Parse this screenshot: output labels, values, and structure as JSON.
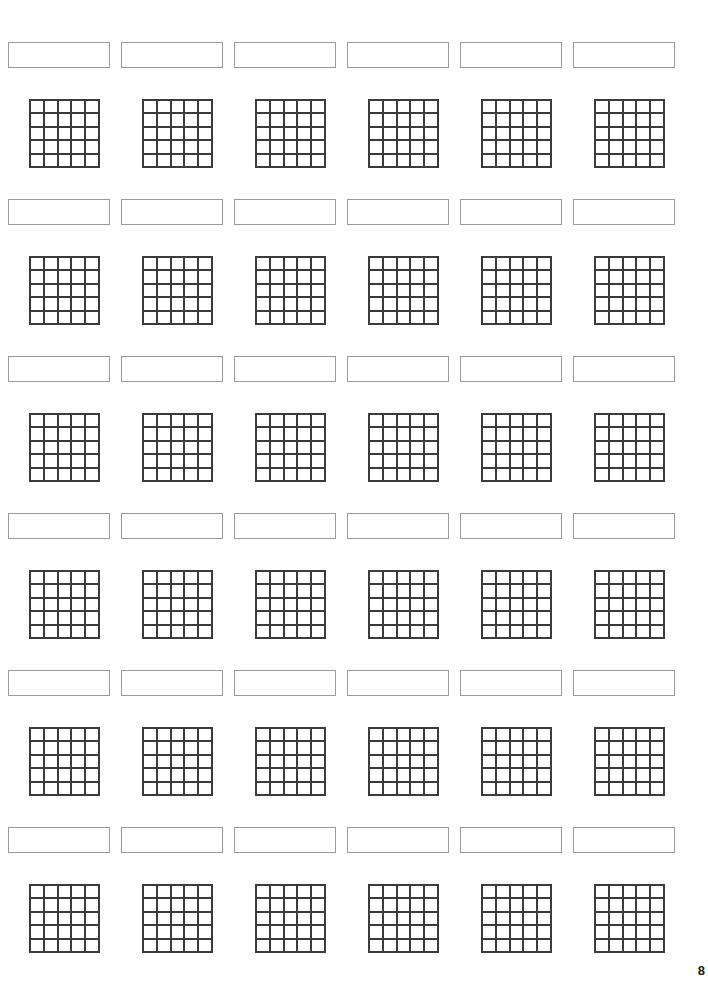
{
  "page": {
    "number": "8",
    "width": 708,
    "height": 981,
    "background_color": "#ffffff"
  },
  "layout": {
    "columns": 6,
    "row_pairs": 6,
    "column_pitch": 113,
    "column_start_x": 8,
    "row_pitch": 157,
    "label_row_start_y": 42,
    "grid_row_start_y": 99,
    "label_box_width": 102,
    "label_box_height": 26,
    "grid_width": 71,
    "grid_height": 69,
    "grid_offset_x": 21,
    "grid_rows": 5,
    "grid_cols": 5
  },
  "colors": {
    "label_border": "#9a9a9a",
    "grid_line": "#3b3b3b",
    "cell_fill": "#ffffff",
    "page_number": "#1a1a1a"
  },
  "rows": [
    {
      "index": 1,
      "labels": [
        "",
        "",
        "",
        "",
        "",
        ""
      ],
      "grids": [
        {
          "cells": [
            "",
            "",
            "",
            "",
            "",
            "",
            "",
            "",
            "",
            "",
            "",
            "",
            "",
            "",
            "",
            "",
            "",
            "",
            "",
            "",
            "",
            "",
            "",
            "",
            ""
          ]
        },
        {
          "cells": [
            "",
            "",
            "",
            "",
            "",
            "",
            "",
            "",
            "",
            "",
            "",
            "",
            "",
            "",
            "",
            "",
            "",
            "",
            "",
            "",
            "",
            "",
            "",
            "",
            ""
          ]
        },
        {
          "cells": [
            "",
            "",
            "",
            "",
            "",
            "",
            "",
            "",
            "",
            "",
            "",
            "",
            "",
            "",
            "",
            "",
            "",
            "",
            "",
            "",
            "",
            "",
            "",
            "",
            ""
          ]
        },
        {
          "cells": [
            "",
            "",
            "",
            "",
            "",
            "",
            "",
            "",
            "",
            "",
            "",
            "",
            "",
            "",
            "",
            "",
            "",
            "",
            "",
            "",
            "",
            "",
            "",
            "",
            ""
          ]
        },
        {
          "cells": [
            "",
            "",
            "",
            "",
            "",
            "",
            "",
            "",
            "",
            "",
            "",
            "",
            "",
            "",
            "",
            "",
            "",
            "",
            "",
            "",
            "",
            "",
            "",
            "",
            ""
          ]
        },
        {
          "cells": [
            "",
            "",
            "",
            "",
            "",
            "",
            "",
            "",
            "",
            "",
            "",
            "",
            "",
            "",
            "",
            "",
            "",
            "",
            "",
            "",
            "",
            "",
            "",
            "",
            ""
          ]
        }
      ]
    },
    {
      "index": 2,
      "labels": [
        "",
        "",
        "",
        "",
        "",
        ""
      ],
      "grids": [
        {
          "cells": [
            "",
            "",
            "",
            "",
            "",
            "",
            "",
            "",
            "",
            "",
            "",
            "",
            "",
            "",
            "",
            "",
            "",
            "",
            "",
            "",
            "",
            "",
            "",
            "",
            ""
          ]
        },
        {
          "cells": [
            "",
            "",
            "",
            "",
            "",
            "",
            "",
            "",
            "",
            "",
            "",
            "",
            "",
            "",
            "",
            "",
            "",
            "",
            "",
            "",
            "",
            "",
            "",
            "",
            ""
          ]
        },
        {
          "cells": [
            "",
            "",
            "",
            "",
            "",
            "",
            "",
            "",
            "",
            "",
            "",
            "",
            "",
            "",
            "",
            "",
            "",
            "",
            "",
            "",
            "",
            "",
            "",
            "",
            ""
          ]
        },
        {
          "cells": [
            "",
            "",
            "",
            "",
            "",
            "",
            "",
            "",
            "",
            "",
            "",
            "",
            "",
            "",
            "",
            "",
            "",
            "",
            "",
            "",
            "",
            "",
            "",
            "",
            ""
          ]
        },
        {
          "cells": [
            "",
            "",
            "",
            "",
            "",
            "",
            "",
            "",
            "",
            "",
            "",
            "",
            "",
            "",
            "",
            "",
            "",
            "",
            "",
            "",
            "",
            "",
            "",
            "",
            ""
          ]
        },
        {
          "cells": [
            "",
            "",
            "",
            "",
            "",
            "",
            "",
            "",
            "",
            "",
            "",
            "",
            "",
            "",
            "",
            "",
            "",
            "",
            "",
            "",
            "",
            "",
            "",
            "",
            ""
          ]
        }
      ]
    },
    {
      "index": 3,
      "labels": [
        "",
        "",
        "",
        "",
        "",
        ""
      ],
      "grids": [
        {
          "cells": [
            "",
            "",
            "",
            "",
            "",
            "",
            "",
            "",
            "",
            "",
            "",
            "",
            "",
            "",
            "",
            "",
            "",
            "",
            "",
            "",
            "",
            "",
            "",
            "",
            ""
          ]
        },
        {
          "cells": [
            "",
            "",
            "",
            "",
            "",
            "",
            "",
            "",
            "",
            "",
            "",
            "",
            "",
            "",
            "",
            "",
            "",
            "",
            "",
            "",
            "",
            "",
            "",
            "",
            ""
          ]
        },
        {
          "cells": [
            "",
            "",
            "",
            "",
            "",
            "",
            "",
            "",
            "",
            "",
            "",
            "",
            "",
            "",
            "",
            "",
            "",
            "",
            "",
            "",
            "",
            "",
            "",
            "",
            ""
          ]
        },
        {
          "cells": [
            "",
            "",
            "",
            "",
            "",
            "",
            "",
            "",
            "",
            "",
            "",
            "",
            "",
            "",
            "",
            "",
            "",
            "",
            "",
            "",
            "",
            "",
            "",
            "",
            ""
          ]
        },
        {
          "cells": [
            "",
            "",
            "",
            "",
            "",
            "",
            "",
            "",
            "",
            "",
            "",
            "",
            "",
            "",
            "",
            "",
            "",
            "",
            "",
            "",
            "",
            "",
            "",
            "",
            ""
          ]
        },
        {
          "cells": [
            "",
            "",
            "",
            "",
            "",
            "",
            "",
            "",
            "",
            "",
            "",
            "",
            "",
            "",
            "",
            "",
            "",
            "",
            "",
            "",
            "",
            "",
            "",
            "",
            ""
          ]
        }
      ]
    },
    {
      "index": 4,
      "labels": [
        "",
        "",
        "",
        "",
        "",
        ""
      ],
      "grids": [
        {
          "cells": [
            "",
            "",
            "",
            "",
            "",
            "",
            "",
            "",
            "",
            "",
            "",
            "",
            "",
            "",
            "",
            "",
            "",
            "",
            "",
            "",
            "",
            "",
            "",
            "",
            ""
          ]
        },
        {
          "cells": [
            "",
            "",
            "",
            "",
            "",
            "",
            "",
            "",
            "",
            "",
            "",
            "",
            "",
            "",
            "",
            "",
            "",
            "",
            "",
            "",
            "",
            "",
            "",
            "",
            ""
          ]
        },
        {
          "cells": [
            "",
            "",
            "",
            "",
            "",
            "",
            "",
            "",
            "",
            "",
            "",
            "",
            "",
            "",
            "",
            "",
            "",
            "",
            "",
            "",
            "",
            "",
            "",
            "",
            ""
          ]
        },
        {
          "cells": [
            "",
            "",
            "",
            "",
            "",
            "",
            "",
            "",
            "",
            "",
            "",
            "",
            "",
            "",
            "",
            "",
            "",
            "",
            "",
            "",
            "",
            "",
            "",
            "",
            ""
          ]
        },
        {
          "cells": [
            "",
            "",
            "",
            "",
            "",
            "",
            "",
            "",
            "",
            "",
            "",
            "",
            "",
            "",
            "",
            "",
            "",
            "",
            "",
            "",
            "",
            "",
            "",
            "",
            ""
          ]
        },
        {
          "cells": [
            "",
            "",
            "",
            "",
            "",
            "",
            "",
            "",
            "",
            "",
            "",
            "",
            "",
            "",
            "",
            "",
            "",
            "",
            "",
            "",
            "",
            "",
            "",
            "",
            ""
          ]
        }
      ]
    },
    {
      "index": 5,
      "labels": [
        "",
        "",
        "",
        "",
        "",
        ""
      ],
      "grids": [
        {
          "cells": [
            "",
            "",
            "",
            "",
            "",
            "",
            "",
            "",
            "",
            "",
            "",
            "",
            "",
            "",
            "",
            "",
            "",
            "",
            "",
            "",
            "",
            "",
            "",
            "",
            ""
          ]
        },
        {
          "cells": [
            "",
            "",
            "",
            "",
            "",
            "",
            "",
            "",
            "",
            "",
            "",
            "",
            "",
            "",
            "",
            "",
            "",
            "",
            "",
            "",
            "",
            "",
            "",
            "",
            ""
          ]
        },
        {
          "cells": [
            "",
            "",
            "",
            "",
            "",
            "",
            "",
            "",
            "",
            "",
            "",
            "",
            "",
            "",
            "",
            "",
            "",
            "",
            "",
            "",
            "",
            "",
            "",
            "",
            ""
          ]
        },
        {
          "cells": [
            "",
            "",
            "",
            "",
            "",
            "",
            "",
            "",
            "",
            "",
            "",
            "",
            "",
            "",
            "",
            "",
            "",
            "",
            "",
            "",
            "",
            "",
            "",
            "",
            ""
          ]
        },
        {
          "cells": [
            "",
            "",
            "",
            "",
            "",
            "",
            "",
            "",
            "",
            "",
            "",
            "",
            "",
            "",
            "",
            "",
            "",
            "",
            "",
            "",
            "",
            "",
            "",
            "",
            ""
          ]
        },
        {
          "cells": [
            "",
            "",
            "",
            "",
            "",
            "",
            "",
            "",
            "",
            "",
            "",
            "",
            "",
            "",
            "",
            "",
            "",
            "",
            "",
            "",
            "",
            "",
            "",
            "",
            ""
          ]
        }
      ]
    },
    {
      "index": 6,
      "labels": [
        "",
        "",
        "",
        "",
        "",
        ""
      ],
      "grids": [
        {
          "cells": [
            "",
            "",
            "",
            "",
            "",
            "",
            "",
            "",
            "",
            "",
            "",
            "",
            "",
            "",
            "",
            "",
            "",
            "",
            "",
            "",
            "",
            "",
            "",
            "",
            ""
          ]
        },
        {
          "cells": [
            "",
            "",
            "",
            "",
            "",
            "",
            "",
            "",
            "",
            "",
            "",
            "",
            "",
            "",
            "",
            "",
            "",
            "",
            "",
            "",
            "",
            "",
            "",
            "",
            ""
          ]
        },
        {
          "cells": [
            "",
            "",
            "",
            "",
            "",
            "",
            "",
            "",
            "",
            "",
            "",
            "",
            "",
            "",
            "",
            "",
            "",
            "",
            "",
            "",
            "",
            "",
            "",
            "",
            ""
          ]
        },
        {
          "cells": [
            "",
            "",
            "",
            "",
            "",
            "",
            "",
            "",
            "",
            "",
            "",
            "",
            "",
            "",
            "",
            "",
            "",
            "",
            "",
            "",
            "",
            "",
            "",
            "",
            ""
          ]
        },
        {
          "cells": [
            "",
            "",
            "",
            "",
            "",
            "",
            "",
            "",
            "",
            "",
            "",
            "",
            "",
            "",
            "",
            "",
            "",
            "",
            "",
            "",
            "",
            "",
            "",
            "",
            ""
          ]
        },
        {
          "cells": [
            "",
            "",
            "",
            "",
            "",
            "",
            "",
            "",
            "",
            "",
            "",
            "",
            "",
            "",
            "",
            "",
            "",
            "",
            "",
            "",
            "",
            "",
            "",
            "",
            ""
          ]
        }
      ]
    }
  ]
}
